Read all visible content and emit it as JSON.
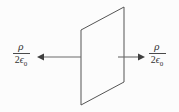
{
  "figure": {
    "background_color": "#fcfcfc",
    "line_color": "#555555",
    "text_color": "#333333",
    "plane": {
      "name": "charged-plane",
      "shape": "parallelogram",
      "points": "81,30 124,7 124,82 81,105",
      "stroke": "#555555",
      "stroke_width": "1",
      "fill": "none"
    },
    "arrows": [
      {
        "name": "field-arrow-left",
        "direction": "left",
        "shaft_x1": 81,
        "shaft_x2": 43,
        "y": 57,
        "head": "37,57 44,53.5 44,60.5"
      },
      {
        "name": "field-arrow-right",
        "direction": "right",
        "shaft_x1": 118,
        "shaft_x2": 138,
        "y": 57,
        "head": "145,57 138,53.5 138,60.5"
      }
    ],
    "labels": {
      "left": {
        "numerator": "ρ",
        "denominator_coefficient": "2",
        "denominator_symbol": "ϵ",
        "denominator_subscript": "0",
        "plain": "ρ / 2ϵ₀"
      },
      "right": {
        "numerator": "ρ",
        "denominator_coefficient": "2",
        "denominator_symbol": "ϵ",
        "denominator_subscript": "0",
        "plain": "ρ / 2ϵ₀"
      }
    }
  }
}
